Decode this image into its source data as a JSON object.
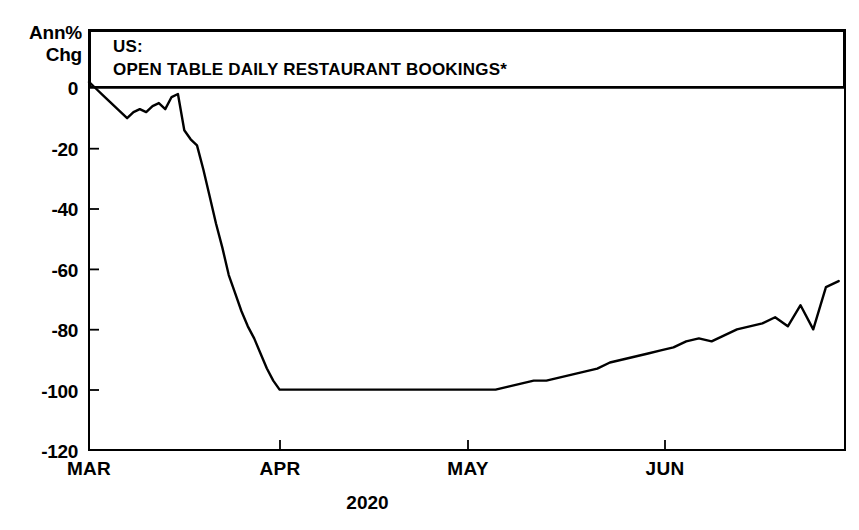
{
  "axis": {
    "y_unit_line1": "Ann%",
    "y_unit_line2": "Chg",
    "x_title": "2020"
  },
  "title": {
    "line1": "US:",
    "line2": "OPEN TABLE DAILY RESTAURANT BOOKINGS*"
  },
  "chart_data": {
    "type": "line",
    "title": "US: OPEN TABLE DAILY RESTAURANT BOOKINGS*",
    "subtitle": "",
    "xlabel": "2020",
    "ylabel": "Ann% Chg",
    "grid": false,
    "legend": null,
    "ylim": [
      -120,
      5
    ],
    "yticks": [
      0,
      -20,
      -40,
      -60,
      -80,
      -100,
      -120
    ],
    "ytick_labels": [
      "0",
      "-20",
      "-40",
      "-60",
      "-80",
      "-100",
      "-120"
    ],
    "xticks": [
      "MAR",
      "APR",
      "MAY",
      "JUN"
    ],
    "xtick_labels": [
      "MAR",
      "APR",
      "MAY",
      "JUN"
    ],
    "xlim": [
      "2020-03-01",
      "2020-06-28"
    ],
    "line_color": "#000000",
    "line_width": 2.4,
    "series": [
      {
        "name": "OpenTable daily restaurant bookings, annual % change",
        "x": [
          "2020-03-01",
          "2020-03-02",
          "2020-03-03",
          "2020-03-04",
          "2020-03-05",
          "2020-03-06",
          "2020-03-07",
          "2020-03-08",
          "2020-03-09",
          "2020-03-10",
          "2020-03-11",
          "2020-03-12",
          "2020-03-13",
          "2020-03-14",
          "2020-03-15",
          "2020-03-16",
          "2020-03-17",
          "2020-03-18",
          "2020-03-19",
          "2020-03-20",
          "2020-03-21",
          "2020-03-22",
          "2020-03-23",
          "2020-03-24",
          "2020-03-25",
          "2020-03-26",
          "2020-03-27",
          "2020-03-28",
          "2020-03-29",
          "2020-03-30",
          "2020-03-31",
          "2020-04-05",
          "2020-04-10",
          "2020-04-15",
          "2020-04-20",
          "2020-04-25",
          "2020-04-30",
          "2020-05-02",
          "2020-05-04",
          "2020-05-06",
          "2020-05-08",
          "2020-05-10",
          "2020-05-12",
          "2020-05-14",
          "2020-05-16",
          "2020-05-18",
          "2020-05-20",
          "2020-05-22",
          "2020-05-24",
          "2020-05-26",
          "2020-05-28",
          "2020-05-30",
          "2020-06-01",
          "2020-06-03",
          "2020-06-05",
          "2020-06-07",
          "2020-06-09",
          "2020-06-11",
          "2020-06-13",
          "2020-06-15",
          "2020-06-17",
          "2020-06-19",
          "2020-06-21",
          "2020-06-23",
          "2020-06-25",
          "2020-06-27"
        ],
        "values": [
          2,
          0,
          -2,
          -4,
          -6,
          -8,
          -10,
          -8,
          -7,
          -8,
          -6,
          -5,
          -7,
          -3,
          -2,
          -14,
          -17,
          -19,
          -27,
          -36,
          -45,
          -53,
          -62,
          -68,
          -74,
          -79,
          -83,
          -88,
          -93,
          -97,
          -100,
          -100,
          -100,
          -100,
          -100,
          -100,
          -100,
          -100,
          -100,
          -99,
          -98,
          -97,
          -97,
          -96,
          -95,
          -94,
          -93,
          -91,
          -90,
          -89,
          -88,
          -87,
          -86,
          -84,
          -83,
          -84,
          -82,
          -80,
          -79,
          -78,
          -76,
          -79,
          -72,
          -80,
          -66,
          -64
        ],
        "annotations": [
          {
            "label": "trough plateau",
            "value": -100,
            "range": "mid-March to early May"
          },
          {
            "label": "late-June spike high",
            "value": -43
          },
          {
            "label": "late-June dip",
            "value": -80
          },
          {
            "label": "final value",
            "value": -64
          }
        ]
      }
    ]
  }
}
